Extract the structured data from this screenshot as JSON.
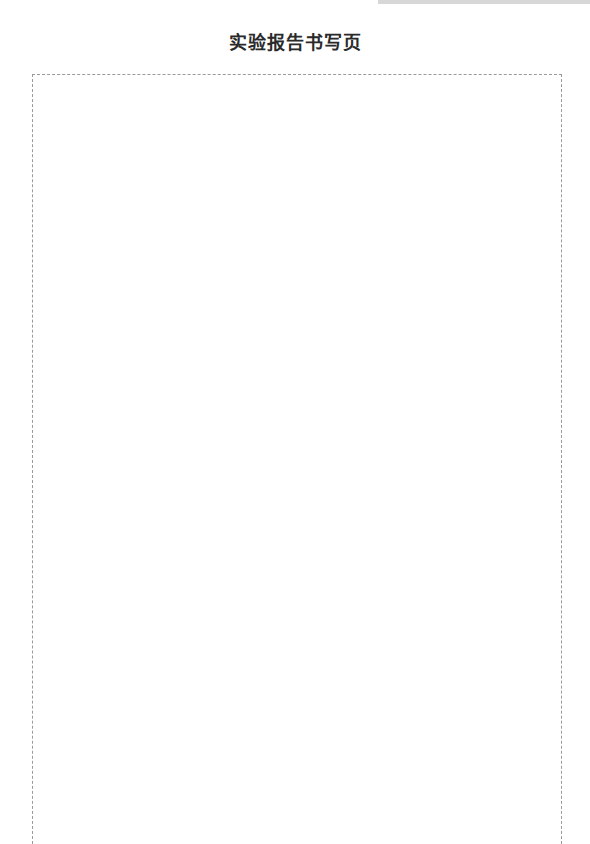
{
  "page": {
    "title": "实验报告书写页"
  },
  "colors": {
    "title_text": "#2a2a2a",
    "border": "#9a9a9a",
    "header_strip": "#d7d7d7"
  }
}
